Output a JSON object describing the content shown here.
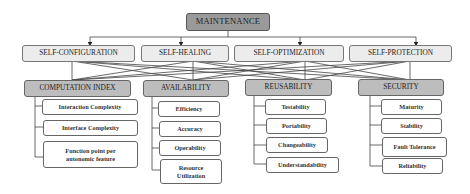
{
  "diagram": {
    "root": {
      "label": "MAINTENANCE"
    },
    "self_properties": [
      {
        "label": "SELF-CONFIGURATION"
      },
      {
        "label": "SELF-HEALING"
      },
      {
        "label": "SELF-OPTIMIZATION"
      },
      {
        "label": "SELF-PROTECTION"
      }
    ],
    "categories": [
      {
        "label": "COMPUTATION INDEX",
        "items": [
          "Interaction Complexity",
          "Interface Complexity",
          "Function point per autonomic feature"
        ]
      },
      {
        "label": "AVAILABILITY",
        "items": [
          "Efficiency",
          "Accuracy",
          "Operability",
          "Resource Utilization"
        ]
      },
      {
        "label": "REUSABILITY",
        "items": [
          "Testability",
          "Portability",
          "Changeability",
          "Understandability"
        ]
      },
      {
        "label": "SECURITY",
        "items": [
          "Maturity",
          "Stability",
          "Fault Tolerance",
          "Reliability"
        ]
      }
    ],
    "colors": {
      "root_fill": "#9a9a9a",
      "level2_fill": "#ececec",
      "level3_fill": "#bdbdbd",
      "leaf_fill": "#ffffff",
      "line": "#333333"
    }
  }
}
